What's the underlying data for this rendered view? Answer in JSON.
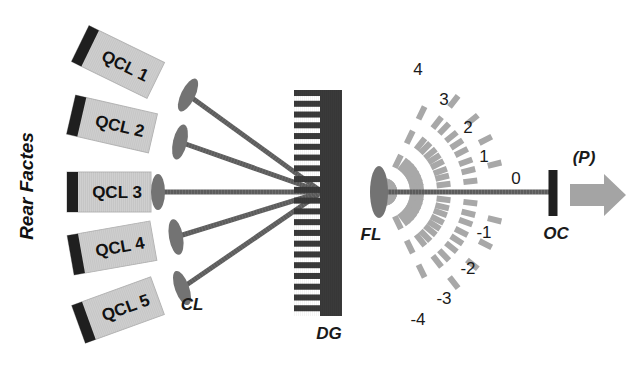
{
  "figure": {
    "background": "#ffffff",
    "width": 643,
    "height": 367
  },
  "colors": {
    "qcl_body": "#cfcfcf",
    "qcl_body_edge": "#b6b6b6",
    "rear_facet": "#1f1f1f",
    "lens": "#737373",
    "beam": "#5c5c5c",
    "grating": "#3a3a3a",
    "diffraction_ray": "#a8a8a8",
    "output_coupler": "#1f1f1f",
    "output_arrow": "#a4a4a4",
    "text": "#1a1a1a"
  },
  "annotations": {
    "rear_facets": "Rear Factes",
    "collimating_lens": "CL",
    "diffraction_grating": "DG",
    "focusing_lens": "FL",
    "output_coupler": "OC",
    "output_power": "(P)"
  },
  "lasers": [
    {
      "id": "qcl-1",
      "label": "QCL 1",
      "angle_deg": 26,
      "cx": 118,
      "cy": 62,
      "lens_x": 188,
      "lens_y": 95
    },
    {
      "id": "qcl-2",
      "label": "QCL 2",
      "angle_deg": 13,
      "cx": 112,
      "cy": 124,
      "lens_x": 180,
      "lens_y": 142
    },
    {
      "id": "qcl-3",
      "label": "QCL 3",
      "angle_deg": 0,
      "cx": 109,
      "cy": 192,
      "lens_x": 158,
      "lens_y": 192
    },
    {
      "id": "qcl-4",
      "label": "QCL 4",
      "angle_deg": -10,
      "cx": 112,
      "cy": 248,
      "lens_x": 176,
      "lens_y": 237
    },
    {
      "id": "qcl-5",
      "label": "QCL 5",
      "angle_deg": -20,
      "cx": 118,
      "cy": 310,
      "lens_x": 182,
      "lens_y": 288
    }
  ],
  "grating": {
    "label": "DG",
    "x": 320,
    "y_top": 90,
    "y_bottom": 316,
    "spine_width": 22,
    "tooth_count": 21,
    "tooth_length": 26
  },
  "focusing_lens": {
    "label": "FL",
    "x": 379,
    "y": 192,
    "rx": 9,
    "ry": 26
  },
  "pivot": {
    "x": 322,
    "y": 192
  },
  "zero_order_beam": {
    "from_x": 379,
    "to_x": 553,
    "y": 192
  },
  "output_coupler": {
    "label": "OC",
    "x": 553,
    "y_top": 170,
    "y_bottom": 216,
    "width": 9
  },
  "output_arrow": {
    "label": "(P)",
    "x": 570,
    "y": 195,
    "length": 56,
    "shaft_height": 22,
    "head_height": 42
  },
  "diffraction_orders": [
    {
      "label": "4",
      "order": 4,
      "angle_deg": -52,
      "label_x": 418,
      "label_y": 75
    },
    {
      "label": "3",
      "order": 3,
      "angle_deg": -39,
      "label_x": 444,
      "label_y": 105
    },
    {
      "label": "2",
      "order": 2,
      "angle_deg": -27,
      "label_x": 468,
      "label_y": 133
    },
    {
      "label": "1",
      "order": 1,
      "angle_deg": -14,
      "label_x": 484,
      "label_y": 162
    },
    {
      "label": "0",
      "order": 0,
      "angle_deg": 0,
      "label_x": 516,
      "label_y": 184
    },
    {
      "label": "-1",
      "order": -1,
      "angle_deg": 14,
      "label_x": 484,
      "label_y": 238
    },
    {
      "label": "-2",
      "order": -2,
      "angle_deg": 27,
      "label_x": 468,
      "label_y": 274
    },
    {
      "label": "-3",
      "order": -3,
      "angle_deg": 39,
      "label_x": 444,
      "label_y": 304
    },
    {
      "label": "-4",
      "order": -4,
      "angle_deg": 52,
      "label_x": 418,
      "label_y": 325
    }
  ],
  "extra_rays_deg": [
    -64,
    -46,
    -33,
    -20,
    -7,
    7,
    20,
    33,
    46,
    64
  ],
  "rear_facets_label": {
    "x": 33,
    "y": 186,
    "rotation_deg": -90
  }
}
